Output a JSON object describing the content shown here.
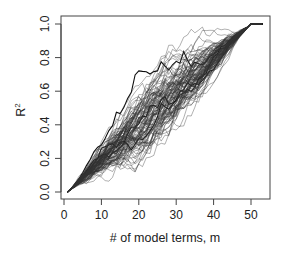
{
  "chart_data": {
    "type": "line",
    "title": "",
    "xlabel": "# of model terms, m",
    "ylabel": "R²",
    "ylabel_base": "R",
    "ylabel_sup": "2",
    "xlim": [
      0,
      55
    ],
    "ylim": [
      0.0,
      1.0
    ],
    "x_ticks": [
      0,
      10,
      20,
      30,
      40,
      50
    ],
    "x_tick_labels": [
      "0",
      "10",
      "20",
      "30",
      "40",
      "50"
    ],
    "y_ticks": [
      0.0,
      0.2,
      0.4,
      0.6,
      0.8,
      1.0
    ],
    "y_tick_labels": [
      "0.0",
      "0.2",
      "0.4",
      "0.6",
      "0.8",
      "1.0"
    ],
    "grid": false,
    "legend": null,
    "series_description": "~100 overlapping stepwise traces of cumulative R² versus number of model terms; each trace starts at (1, 0.0), rises roughly linearly with random fluctuation (spread about ±0.12 around the diagonal), reaches 1.0 at m≈50, and stays flat at 1.0 to m≈53.",
    "n_series": 100,
    "start_point": [
      1,
      0.0
    ],
    "end_point": [
      50,
      1.0
    ],
    "flat_end_x": 53,
    "spread": 0.12,
    "summary_series": [
      {
        "name": "central trend (approx.)",
        "x": [
          1,
          10,
          20,
          30,
          40,
          50,
          53
        ],
        "y": [
          0.0,
          0.2,
          0.4,
          0.6,
          0.78,
          1.0,
          1.0
        ]
      },
      {
        "name": "upper envelope (approx.)",
        "x": [
          1,
          10,
          20,
          30,
          40,
          45,
          50
        ],
        "y": [
          0.0,
          0.33,
          0.55,
          0.74,
          0.92,
          0.98,
          1.0
        ]
      },
      {
        "name": "lower envelope (approx.)",
        "x": [
          1,
          10,
          20,
          30,
          40,
          45,
          50
        ],
        "y": [
          0.0,
          0.1,
          0.27,
          0.45,
          0.64,
          0.78,
          1.0
        ]
      }
    ],
    "line_color": "#333333",
    "emphasis_line_color": "#000000"
  }
}
